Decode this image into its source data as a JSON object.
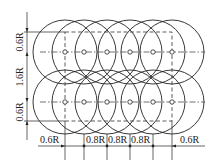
{
  "diagram": {
    "radius_px": 32,
    "rows_y": [
      52,
      102
    ],
    "centers_x": [
      65,
      84,
      107,
      130,
      153,
      172
    ],
    "dashed_rect": {
      "x1": 65,
      "y1": 32,
      "x2": 172,
      "y2": 121
    },
    "vertical_dims": [
      {
        "label": "0.6R",
        "y1": 32,
        "y2": 52
      },
      {
        "label": "1.6R",
        "y1": 52,
        "y2": 102
      },
      {
        "label": "0.6R",
        "y1": 102,
        "y2": 121
      }
    ],
    "horizontal_dims": [
      {
        "label": "0.6R"
      },
      {
        "label": "0.8R"
      },
      {
        "label": "0.8R"
      },
      {
        "label": "0.8R"
      },
      {
        "label": "0.6R"
      }
    ]
  },
  "labels": {
    "v_top": "0.6R",
    "v_mid": "1.6R",
    "v_bot": "0.6R",
    "h_left": "0.6R",
    "h_1": "0.8R",
    "h_2": "0.8R",
    "h_3": "0.8R",
    "h_right": "0.6R"
  }
}
